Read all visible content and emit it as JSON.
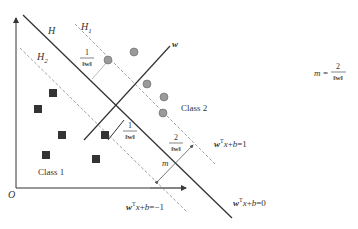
{
  "diagram": {
    "axes": {
      "origin_label": "O"
    },
    "lines": {
      "hyperplane": {
        "label": "H",
        "equation": "wᵀx+b=0"
      },
      "positive_margin": {
        "label": "H1",
        "equation": "wᵀx+b=1"
      },
      "negative_margin": {
        "label": "H2",
        "equation": "wᵀx+b=−1"
      },
      "normal_vector": {
        "label": "w"
      }
    },
    "annotations": {
      "half_margin_top": {
        "numerator": "1",
        "denominator": "‖w‖"
      },
      "half_margin_bottom": {
        "numerator": "1",
        "denominator": "‖w‖"
      },
      "full_margin": {
        "numerator": "2",
        "denominator": "‖w‖"
      },
      "margin_symbol": "m"
    },
    "formula": {
      "lhs": "m",
      "equals": "=",
      "numerator": "2",
      "denominator": "‖w‖"
    },
    "classes": [
      {
        "label": "Class 1",
        "marker": "square",
        "color": "#333333"
      },
      {
        "label": "Class 2",
        "marker": "circle",
        "color": "#999999"
      }
    ],
    "colors": {
      "solid_line": "#333333",
      "dashed_line": "#888888",
      "support_line": "#bbbbbb"
    }
  }
}
